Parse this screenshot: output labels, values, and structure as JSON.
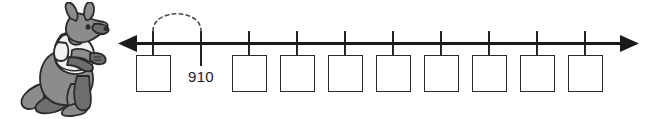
{
  "worksheet": {
    "title": "Number line counting worksheet",
    "width": 646,
    "height": 119,
    "background_color": "#ffffff",
    "ink_color": "#2b2b2b"
  },
  "illustration": {
    "name": "kangaroo-mascot",
    "description": "Grey cartoon kangaroo standing and facing right, wearing a white t-shirt",
    "body_color": "#8c8c8c",
    "shade_color": "#6e6e6e",
    "shirt_color": "#f2f2f2",
    "outline_color": "#2b2b2b",
    "eye_color": "#2b2b2b"
  },
  "number_line": {
    "axis_label": "",
    "arrow_left": "◀",
    "arrow_right": "▶",
    "line_color": "#1a1a1a",
    "line_y": 43,
    "line_start_x": 120,
    "line_end_x": 638,
    "tick_count": 10,
    "tick_spacing": 48,
    "jump_arc": {
      "name": "skip-count-jump",
      "style": "dashed",
      "from_tick_index": 0,
      "to_tick_index": 1,
      "label": ""
    },
    "ticks": [
      {
        "index": 0,
        "x": 153,
        "label": "",
        "has_box": true,
        "box_value": ""
      },
      {
        "index": 1,
        "x": 201,
        "label": "910",
        "has_box": false,
        "box_value": ""
      },
      {
        "index": 2,
        "x": 249,
        "label": "",
        "has_box": true,
        "box_value": ""
      },
      {
        "index": 3,
        "x": 297,
        "label": "",
        "has_box": true,
        "box_value": ""
      },
      {
        "index": 4,
        "x": 345,
        "label": "",
        "has_box": true,
        "box_value": ""
      },
      {
        "index": 5,
        "x": 393,
        "label": "",
        "has_box": true,
        "box_value": ""
      },
      {
        "index": 6,
        "x": 441,
        "label": "",
        "has_box": true,
        "box_value": ""
      },
      {
        "index": 7,
        "x": 489,
        "label": "",
        "has_box": true,
        "box_value": ""
      },
      {
        "index": 8,
        "x": 537,
        "label": "",
        "has_box": true,
        "box_value": ""
      },
      {
        "index": 9,
        "x": 585,
        "label": "",
        "has_box": true,
        "box_value": ""
      }
    ],
    "box": {
      "width": 35,
      "height": 37,
      "top": 55,
      "stem_height": 12,
      "border_color": "#2b2b2b",
      "fill_color": "#ffffff"
    }
  },
  "labels": {
    "known_value": "910"
  }
}
